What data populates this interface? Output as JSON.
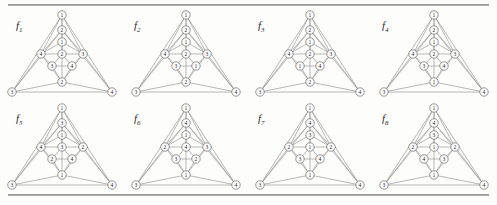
{
  "figure": {
    "kind": "graph-plate",
    "rows": 2,
    "columns": 4,
    "rule_color": "#8e8e8e",
    "edge_color": "#9a9a9a",
    "node_fill": "#ffffff",
    "node_stroke": "#6f6f6f",
    "background": "#fdfdfc"
  },
  "graphs": [
    {
      "id": "f1",
      "label": "f",
      "subscript": "1",
      "nodes": {
        "apex": "1",
        "chain_upper": "2",
        "chain_lower": "1",
        "center": "2",
        "left": "4",
        "right": "3",
        "lower_left": "3",
        "lower_right": "4",
        "bottom_mid": "2",
        "corner_left": "3",
        "corner_right": "4"
      }
    },
    {
      "id": "f2",
      "label": "f",
      "subscript": "2",
      "nodes": {
        "apex": "1",
        "chain_upper": "2",
        "chain_lower": "1",
        "center": "2",
        "left": "4",
        "right": "3",
        "lower_left": "3",
        "lower_right": "1",
        "bottom_mid": "2",
        "corner_left": "3",
        "corner_right": "4"
      }
    },
    {
      "id": "f3",
      "label": "f",
      "subscript": "3",
      "nodes": {
        "apex": "1",
        "chain_upper": "2",
        "chain_lower": "1",
        "center": "2",
        "left": "4",
        "right": "3",
        "lower_left": "1",
        "lower_right": "4",
        "bottom_mid": "2",
        "corner_left": "3",
        "corner_right": "4"
      }
    },
    {
      "id": "f4",
      "label": "f",
      "subscript": "4",
      "nodes": {
        "apex": "1",
        "chain_upper": "2",
        "chain_lower": "1",
        "center": "2",
        "left": "4",
        "right": "3",
        "lower_left": "3",
        "lower_right": "4",
        "bottom_mid": "1",
        "corner_left": "3",
        "corner_right": "4"
      }
    },
    {
      "id": "f5",
      "label": "f",
      "subscript": "5",
      "nodes": {
        "apex": "1",
        "chain_upper": "3",
        "chain_lower": "1",
        "center": "3",
        "left": "4",
        "right": "2",
        "lower_left": "2",
        "lower_right": "4",
        "bottom_mid": "1",
        "corner_left": "3",
        "corner_right": "4"
      }
    },
    {
      "id": "f6",
      "label": "f",
      "subscript": "6",
      "nodes": {
        "apex": "1",
        "chain_upper": "4",
        "chain_lower": "1",
        "center": "4",
        "left": "2",
        "right": "3",
        "lower_left": "3",
        "lower_right": "2",
        "bottom_mid": "1",
        "corner_left": "3",
        "corner_right": "4"
      }
    },
    {
      "id": "f7",
      "label": "f",
      "subscript": "7",
      "nodes": {
        "apex": "1",
        "chain_upper": "4",
        "chain_lower": "3",
        "center": "1",
        "left": "2",
        "right": "2",
        "lower_left": "3",
        "lower_right": "4",
        "bottom_mid": "1",
        "corner_left": "3",
        "corner_right": "4"
      }
    },
    {
      "id": "f8",
      "label": "f",
      "subscript": "8",
      "nodes": {
        "apex": "1",
        "chain_upper": "4",
        "chain_lower": "3",
        "center": "1",
        "left": "2",
        "right": "2",
        "lower_left": "4",
        "lower_right": "3",
        "bottom_mid": "1",
        "corner_left": "3",
        "corner_right": "4"
      }
    }
  ]
}
